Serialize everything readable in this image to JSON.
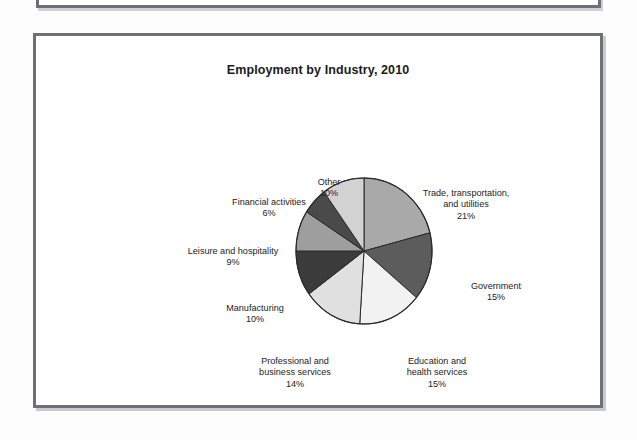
{
  "figure": {
    "title": "Employment by Industry, 2010"
  },
  "chart_data": {
    "type": "pie",
    "title": "Employment by Industry, 2010",
    "xlabel": "",
    "ylabel": "",
    "legend_position": "none",
    "grid": false,
    "value_unit": "percent",
    "start_angle_deg": 0,
    "direction": "clockwise",
    "categories": [
      "Trade, transportation, and utilities",
      "Government",
      "Education and health services",
      "Professional and business services",
      "Manufacturing",
      "Leisure and hospitality",
      "Financial activities",
      "Other"
    ],
    "values": [
      21,
      15,
      15,
      14,
      10,
      9,
      6,
      10
    ],
    "slices": [
      {
        "name": "Trade, transportation, and utilities",
        "label_line1": "Trade, transportation,",
        "label_line2": "and utilities",
        "label_line3": "",
        "value": 21,
        "value_label": "21%",
        "color": "#a9a9a9"
      },
      {
        "name": "Government",
        "label_line1": "Government",
        "label_line2": "",
        "label_line3": "",
        "value": 15,
        "value_label": "15%",
        "color": "#5c5c5c"
      },
      {
        "name": "Education and health services",
        "label_line1": "Education and",
        "label_line2": "health services",
        "label_line3": "",
        "value": 15,
        "value_label": "15%",
        "color": "#f2f2f2"
      },
      {
        "name": "Professional and business services",
        "label_line1": "Professional and",
        "label_line2": "business services",
        "label_line3": "",
        "value": 14,
        "value_label": "14%",
        "color": "#e0e0e0"
      },
      {
        "name": "Manufacturing",
        "label_line1": "Manufacturing",
        "label_line2": "",
        "label_line3": "",
        "value": 10,
        "value_label": "10%",
        "color": "#3b3b3b"
      },
      {
        "name": "Leisure and hospitality",
        "label_line1": "Leisure and hospitality",
        "label_line2": "",
        "label_line3": "",
        "value": 9,
        "value_label": "9%",
        "color": "#9e9e9e"
      },
      {
        "name": "Financial activities",
        "label_line1": "Financial activities",
        "label_line2": "",
        "label_line3": "",
        "value": 6,
        "value_label": "6%",
        "color": "#4a4a4a"
      },
      {
        "name": "Other",
        "label_line1": "Other",
        "label_line2": "",
        "label_line3": "",
        "value": 10,
        "value_label": "10%",
        "color": "#d2d2d2"
      }
    ]
  }
}
